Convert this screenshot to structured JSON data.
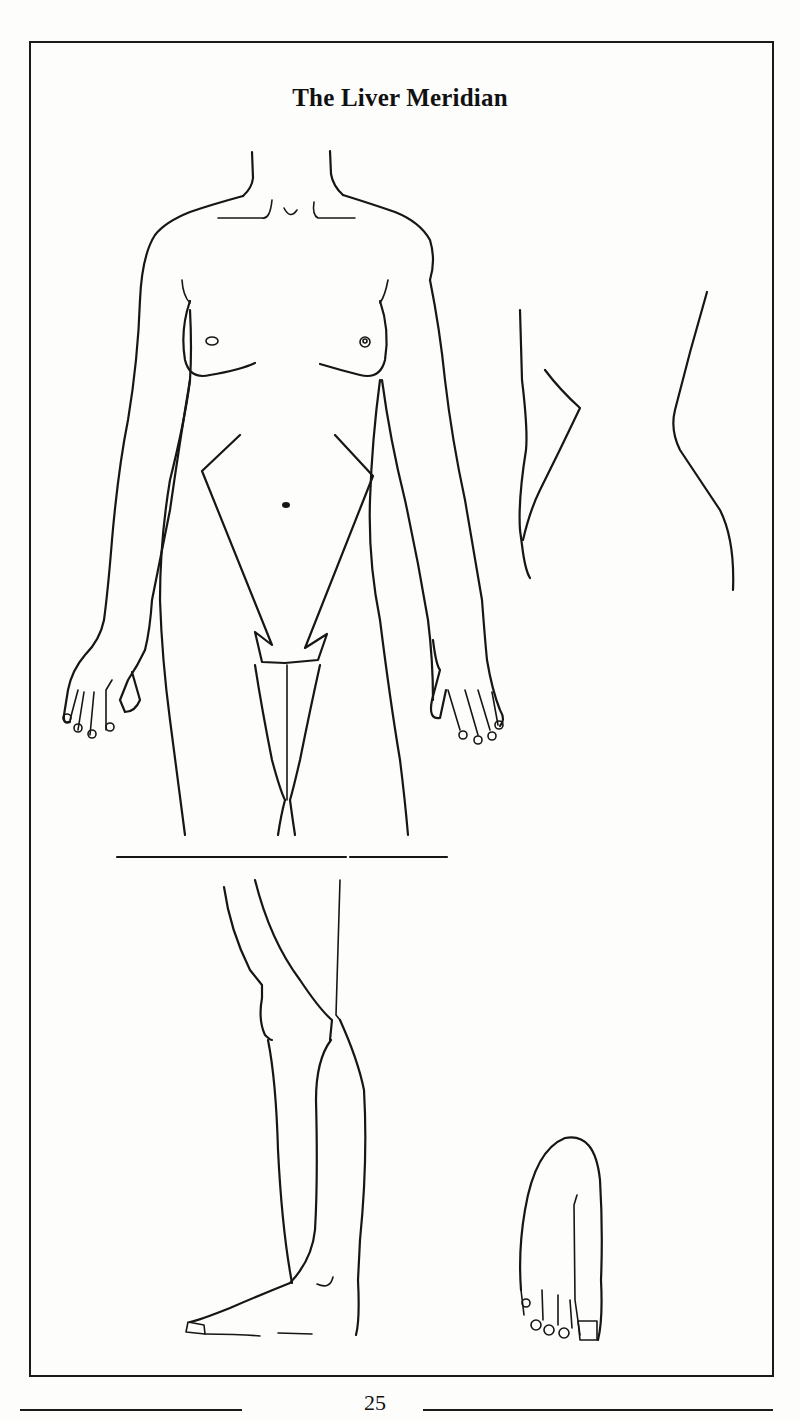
{
  "page": {
    "title": "The Liver Meridian",
    "page_number": "25"
  },
  "figure": {
    "panels": [
      {
        "name": "front-torso-and-arms",
        "description": "Front view of female body from neck to upper thigh with meridian pathway lines on abdomen and inner thigh"
      },
      {
        "name": "side-torso",
        "description": "Side view outline of torso"
      },
      {
        "name": "lower-leg-medial",
        "description": "Medial view of lower leg and foot"
      },
      {
        "name": "foot-top",
        "description": "Top view of foot with toes"
      }
    ],
    "stroke_color": "#161616",
    "background_color": "#fdfdfc"
  }
}
